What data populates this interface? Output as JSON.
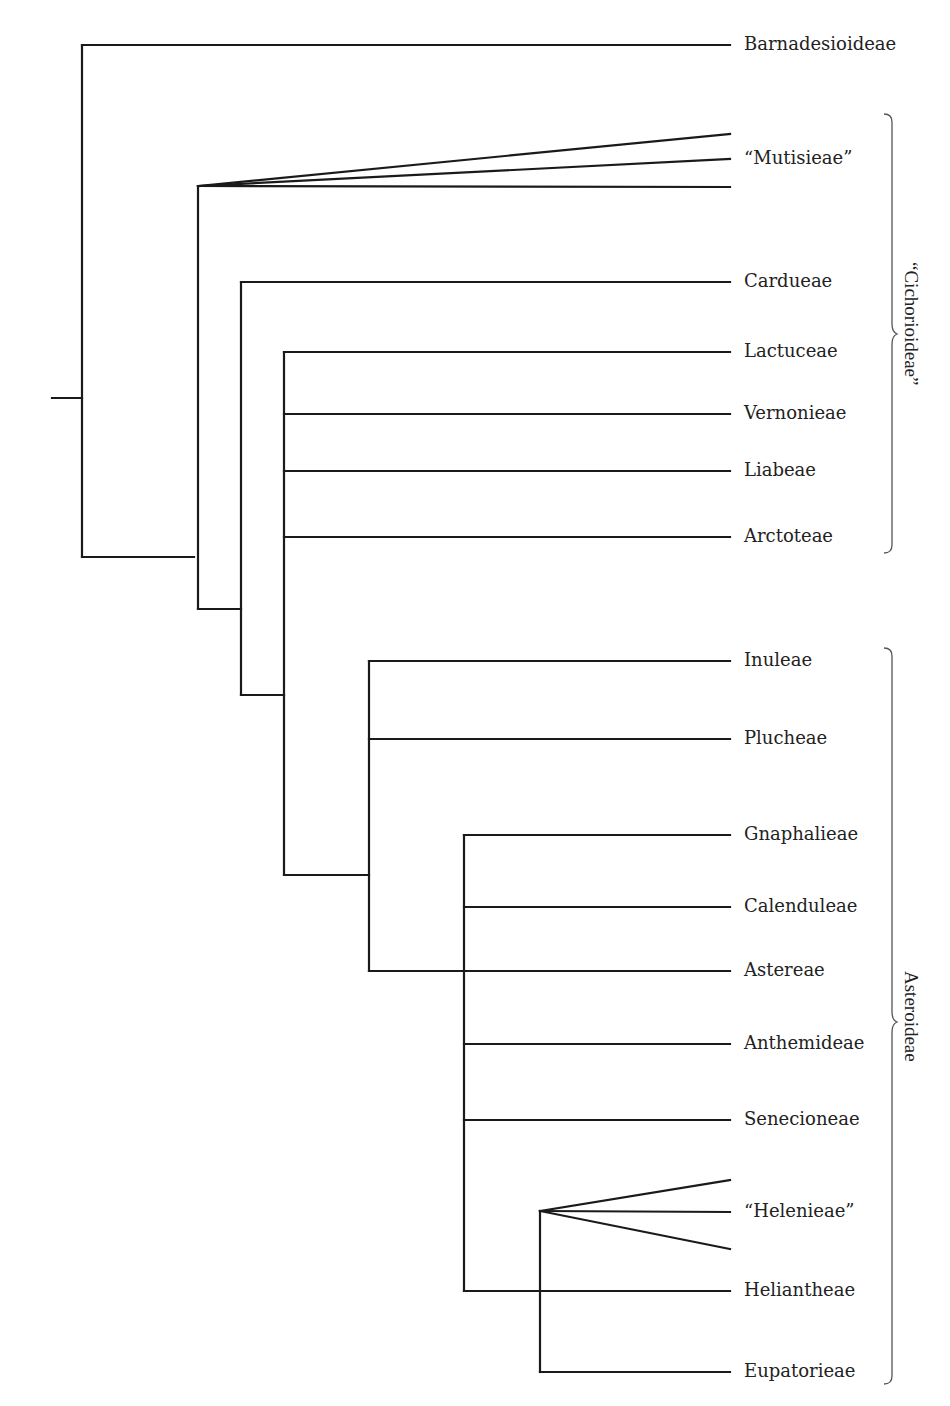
{
  "diagram": {
    "type": "cladogram",
    "taxa": [
      {
        "id": "barnadesioideae",
        "label": "Barnadesioideae",
        "y": 45
      },
      {
        "id": "mutisieae",
        "label": "“Mutisieae”",
        "y": 159
      },
      {
        "id": "cardueae",
        "label": "Cardueae",
        "y": 282
      },
      {
        "id": "lactuceae",
        "label": "Lactuceae",
        "y": 352
      },
      {
        "id": "vernonieae",
        "label": "Vernonieae",
        "y": 414
      },
      {
        "id": "liabeae",
        "label": "Liabeae",
        "y": 471
      },
      {
        "id": "arctoteae",
        "label": "Arctoteae",
        "y": 537
      },
      {
        "id": "inuleae",
        "label": "Inuleae",
        "y": 661
      },
      {
        "id": "plucheae",
        "label": "Plucheae",
        "y": 739
      },
      {
        "id": "gnaphalieae",
        "label": "Gnaphalieae",
        "y": 835
      },
      {
        "id": "calenduleae",
        "label": "Calenduleae",
        "y": 907
      },
      {
        "id": "astereae",
        "label": "Astereae",
        "y": 971
      },
      {
        "id": "anthemideae",
        "label": "Anthemideae",
        "y": 1044
      },
      {
        "id": "senecioneae",
        "label": "Senecioneae",
        "y": 1120
      },
      {
        "id": "helenieae",
        "label": "“Helenieae”",
        "y": 1212
      },
      {
        "id": "heliantheae",
        "label": "Heliantheae",
        "y": 1291
      },
      {
        "id": "eupatorieae",
        "label": "Eupatorieae",
        "y": 1372
      }
    ],
    "groups": [
      {
        "id": "cichorioideae",
        "label": "“Cichorioideae”",
        "y_start": 114,
        "y_end": 553,
        "members": [
          "mutisieae",
          "cardueae",
          "lactuceae",
          "vernonieae",
          "liabeae",
          "arctoteae"
        ]
      },
      {
        "id": "asteroideae",
        "label": "Asteroideae",
        "y_start": 648,
        "y_end": 1384,
        "members": [
          "inuleae",
          "plucheae",
          "gnaphalieae",
          "calenduleae",
          "astereae",
          "anthemideae",
          "senecioneae",
          "helenieae",
          "heliantheae",
          "eupatorieae"
        ]
      }
    ],
    "topology": "(Barnadesioideae,(Mutisieae_polytomy,(Cardueae,(Lactuceae,Vernonieae,Liabeae,Arctoteae,(Inuleae,Plucheae,(Gnaphalieae,Calenduleae,Astereae,Anthemideae,Senecioneae,Heliantheae,(Helenieae_polytomy,Eupatorieae)))))))",
    "line_color": "#1a1a1a",
    "brace_color": "#555555"
  }
}
